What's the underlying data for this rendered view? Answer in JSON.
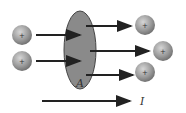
{
  "diagram": {
    "surface_label": "A",
    "current_label": "I",
    "charge_symbol": "+",
    "colors": {
      "surface": "#8a8a8a",
      "charge": "#9a9a9a",
      "arrow": "#222222"
    },
    "incoming_charges": 2,
    "outgoing_charges": 3
  }
}
